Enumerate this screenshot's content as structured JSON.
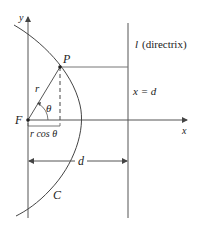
{
  "diagram": {
    "type": "conic-section-polar-focus-directrix",
    "colors": {
      "line": "#555555",
      "curve": "#444444",
      "text": "#222222",
      "background": "#ffffff"
    },
    "labels": {
      "y_axis": "y",
      "x_axis": "x",
      "point": "P",
      "focus": "F",
      "radius": "r",
      "angle": "θ",
      "projection": "r cos θ",
      "directrix_name": "l",
      "directrix_desc": "(directrix)",
      "directrix_eq": "x = d",
      "distance": "d",
      "curve": "C"
    }
  }
}
